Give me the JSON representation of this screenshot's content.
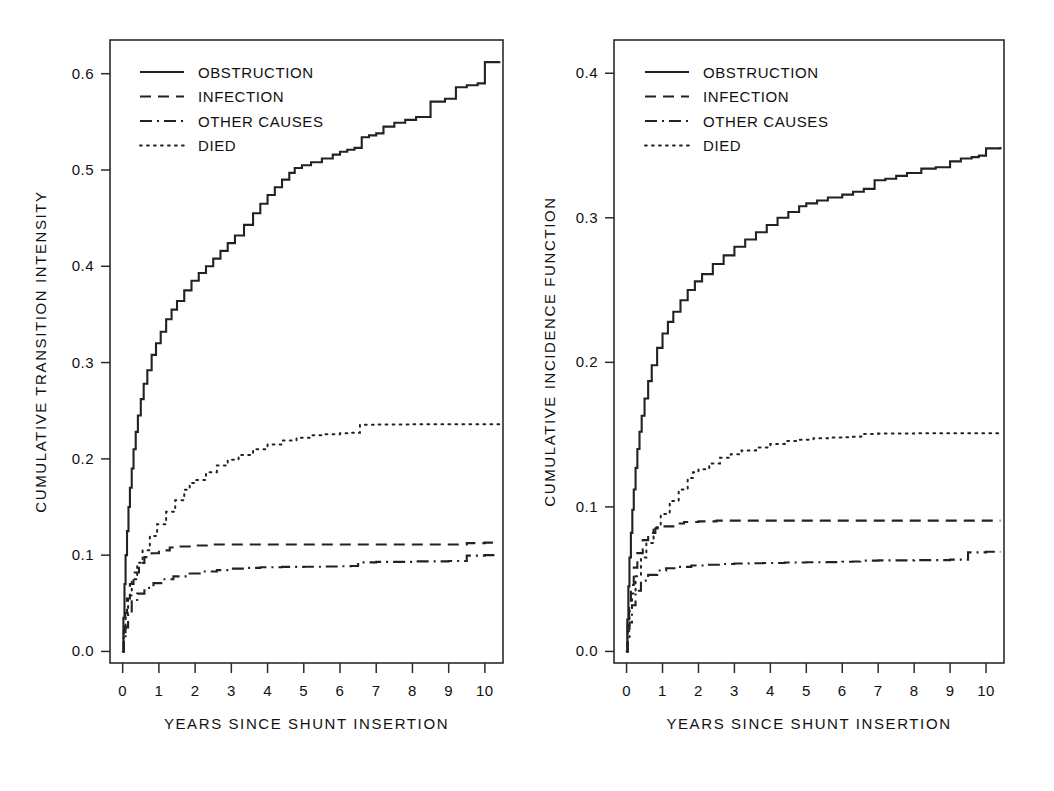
{
  "figure": {
    "background": "#ffffff",
    "line_color": "#222222"
  },
  "panels": [
    {
      "id": "left",
      "ylabel": "CUMULATIVE TRANSITION INTENSITY",
      "xlabel": "YEARS SINCE SHUNT INSERTION",
      "yticks": [
        "0.0",
        "0.1",
        "0.2",
        "0.3",
        "0.4",
        "0.5",
        "0.6"
      ],
      "xticks": [
        "0",
        "1",
        "2",
        "3",
        "4",
        "5",
        "6",
        "7",
        "8",
        "9",
        "10"
      ],
      "legend": [
        {
          "label": "OBSTRUCTION",
          "style": "solid"
        },
        {
          "label": "INFECTION",
          "style": "dashed"
        },
        {
          "label": "OTHER CAUSES",
          "style": "dashdot"
        },
        {
          "label": "DIED",
          "style": "dotted"
        }
      ]
    },
    {
      "id": "right",
      "ylabel": "CUMULATIVE INCIDENCE FUNCTION",
      "xlabel": "YEARS SINCE SHUNT INSERTION",
      "yticks": [
        "0.0",
        "0.1",
        "0.2",
        "0.3",
        "0.4"
      ],
      "xticks": [
        "0",
        "1",
        "2",
        "3",
        "4",
        "5",
        "6",
        "7",
        "8",
        "9",
        "10"
      ],
      "legend": [
        {
          "label": "OBSTRUCTION",
          "style": "solid"
        },
        {
          "label": "INFECTION",
          "style": "dashed"
        },
        {
          "label": "OTHER CAUSES",
          "style": "dashdot"
        },
        {
          "label": "DIED",
          "style": "dotted"
        }
      ]
    }
  ],
  "chart_data": [
    {
      "type": "line",
      "panel": "left",
      "title": "",
      "xlabel": "YEARS SINCE SHUNT INSERTION",
      "ylabel": "CUMULATIVE TRANSITION INTENSITY",
      "xlim": [
        -0.35,
        10.5
      ],
      "ylim": [
        -0.012,
        0.635
      ],
      "xticks": [
        0,
        1,
        2,
        3,
        4,
        5,
        6,
        7,
        8,
        9,
        10
      ],
      "yticks": [
        0.0,
        0.1,
        0.2,
        0.3,
        0.4,
        0.5,
        0.6
      ],
      "grid": false,
      "legend_position": "upper-left",
      "series": [
        {
          "name": "OBSTRUCTION",
          "style": "solid",
          "x": [
            0,
            0.02,
            0.05,
            0.08,
            0.12,
            0.16,
            0.2,
            0.25,
            0.3,
            0.36,
            0.42,
            0.5,
            0.58,
            0.68,
            0.8,
            0.92,
            1.05,
            1.2,
            1.35,
            1.5,
            1.7,
            1.9,
            2.1,
            2.3,
            2.5,
            2.7,
            2.9,
            3.1,
            3.35,
            3.6,
            3.8,
            4.0,
            4.2,
            4.4,
            4.6,
            4.75,
            4.95,
            5.2,
            5.5,
            5.8,
            6.0,
            6.2,
            6.4,
            6.6,
            6.8,
            7.0,
            7.2,
            7.5,
            7.8,
            8.1,
            8.5,
            8.9,
            9.2,
            9.5,
            9.8,
            10.0,
            10.4
          ],
          "y": [
            0.0,
            0.035,
            0.07,
            0.1,
            0.125,
            0.15,
            0.17,
            0.19,
            0.21,
            0.228,
            0.245,
            0.262,
            0.278,
            0.292,
            0.308,
            0.32,
            0.332,
            0.345,
            0.355,
            0.364,
            0.375,
            0.385,
            0.393,
            0.4,
            0.408,
            0.416,
            0.424,
            0.432,
            0.443,
            0.455,
            0.465,
            0.474,
            0.482,
            0.49,
            0.497,
            0.502,
            0.505,
            0.508,
            0.512,
            0.516,
            0.519,
            0.521,
            0.523,
            0.534,
            0.536,
            0.538,
            0.545,
            0.549,
            0.552,
            0.555,
            0.571,
            0.574,
            0.586,
            0.588,
            0.59,
            0.612,
            0.613
          ]
        },
        {
          "name": "INFECTION",
          "style": "dashed",
          "x": [
            0,
            0.03,
            0.07,
            0.12,
            0.2,
            0.3,
            0.45,
            0.6,
            0.8,
            1.0,
            1.3,
            1.6,
            2.0,
            2.5,
            3.0,
            4.0,
            5.0,
            6.0,
            7.0,
            8.0,
            9.0,
            9.3,
            9.5,
            10.0,
            10.4
          ],
          "y": [
            0.0,
            0.022,
            0.04,
            0.055,
            0.07,
            0.082,
            0.092,
            0.098,
            0.102,
            0.105,
            0.108,
            0.109,
            0.11,
            0.111,
            0.111,
            0.111,
            0.111,
            0.111,
            0.111,
            0.111,
            0.111,
            0.111,
            0.1125,
            0.113,
            0.113
          ]
        },
        {
          "name": "OTHER CAUSES",
          "style": "dashdot",
          "x": [
            0,
            0.03,
            0.08,
            0.15,
            0.25,
            0.4,
            0.6,
            0.85,
            1.1,
            1.4,
            1.8,
            2.2,
            2.6,
            3.0,
            3.4,
            3.8,
            4.4,
            5.0,
            5.6,
            6.0,
            6.3,
            6.5,
            7.0,
            8.0,
            9.0,
            9.3,
            9.5,
            10.0,
            10.4
          ],
          "y": [
            0.0,
            0.012,
            0.025,
            0.04,
            0.052,
            0.06,
            0.066,
            0.071,
            0.075,
            0.078,
            0.081,
            0.083,
            0.0845,
            0.086,
            0.0868,
            0.0875,
            0.0878,
            0.088,
            0.0882,
            0.0885,
            0.0888,
            0.0925,
            0.093,
            0.0935,
            0.094,
            0.094,
            0.0995,
            0.1,
            0.1
          ]
        },
        {
          "name": "DIED",
          "style": "dotted",
          "x": [
            0,
            0.03,
            0.08,
            0.15,
            0.25,
            0.4,
            0.55,
            0.75,
            0.95,
            1.2,
            1.45,
            1.7,
            1.85,
            2.0,
            2.3,
            2.6,
            2.9,
            3.2,
            3.6,
            4.0,
            4.4,
            4.8,
            5.2,
            5.6,
            6.0,
            6.3,
            6.5,
            6.55,
            7.0,
            8.0,
            9.0,
            10.0,
            10.4
          ],
          "y": [
            0.0,
            0.02,
            0.04,
            0.058,
            0.075,
            0.092,
            0.105,
            0.12,
            0.132,
            0.145,
            0.157,
            0.168,
            0.175,
            0.178,
            0.186,
            0.193,
            0.199,
            0.204,
            0.21,
            0.215,
            0.219,
            0.222,
            0.2245,
            0.2255,
            0.2265,
            0.227,
            0.2272,
            0.2355,
            0.2358,
            0.236,
            0.236,
            0.236,
            0.236
          ]
        }
      ]
    },
    {
      "type": "line",
      "panel": "right",
      "title": "",
      "xlabel": "YEARS SINCE SHUNT INSERTION",
      "ylabel": "CUMULATIVE INCIDENCE FUNCTION",
      "xlim": [
        -0.35,
        10.5
      ],
      "ylim": [
        -0.008,
        0.423
      ],
      "xticks": [
        0,
        1,
        2,
        3,
        4,
        5,
        6,
        7,
        8,
        9,
        10
      ],
      "yticks": [
        0.0,
        0.1,
        0.2,
        0.3,
        0.4
      ],
      "grid": false,
      "legend_position": "upper-left",
      "series": [
        {
          "name": "OBSTRUCTION",
          "style": "solid",
          "x": [
            0,
            0.02,
            0.05,
            0.08,
            0.12,
            0.16,
            0.2,
            0.25,
            0.3,
            0.36,
            0.42,
            0.5,
            0.6,
            0.7,
            0.85,
            1.0,
            1.15,
            1.3,
            1.5,
            1.7,
            1.9,
            2.1,
            2.4,
            2.7,
            3.0,
            3.3,
            3.6,
            3.9,
            4.2,
            4.5,
            4.8,
            5.0,
            5.3,
            5.6,
            6.0,
            6.3,
            6.6,
            6.9,
            7.2,
            7.5,
            7.8,
            8.2,
            8.6,
            9.0,
            9.3,
            9.6,
            9.8,
            10.0,
            10.4
          ],
          "y": [
            0.0,
            0.022,
            0.045,
            0.065,
            0.082,
            0.098,
            0.112,
            0.127,
            0.14,
            0.152,
            0.163,
            0.175,
            0.187,
            0.198,
            0.21,
            0.22,
            0.228,
            0.235,
            0.243,
            0.25,
            0.256,
            0.261,
            0.268,
            0.274,
            0.28,
            0.285,
            0.29,
            0.295,
            0.3,
            0.304,
            0.308,
            0.31,
            0.312,
            0.314,
            0.316,
            0.318,
            0.32,
            0.326,
            0.327,
            0.329,
            0.331,
            0.334,
            0.335,
            0.339,
            0.341,
            0.342,
            0.343,
            0.348,
            0.349
          ]
        },
        {
          "name": "INFECTION",
          "style": "dashed",
          "x": [
            0,
            0.03,
            0.07,
            0.12,
            0.2,
            0.3,
            0.45,
            0.6,
            0.8,
            1.0,
            1.3,
            1.6,
            2.0,
            2.5,
            3.0,
            4.0,
            5.0,
            6.0,
            7.0,
            8.0,
            9.0,
            10.0,
            10.4
          ],
          "y": [
            0.0,
            0.018,
            0.033,
            0.046,
            0.058,
            0.068,
            0.077,
            0.082,
            0.085,
            0.0865,
            0.0885,
            0.0895,
            0.09,
            0.0905,
            0.0905,
            0.0905,
            0.0905,
            0.0905,
            0.0905,
            0.0905,
            0.0905,
            0.0905,
            0.0905
          ]
        },
        {
          "name": "OTHER CAUSES",
          "style": "dashdot",
          "x": [
            0,
            0.03,
            0.08,
            0.15,
            0.25,
            0.4,
            0.6,
            0.85,
            1.1,
            1.4,
            1.8,
            2.2,
            2.6,
            3.0,
            3.4,
            3.8,
            4.4,
            5.0,
            5.6,
            6.0,
            6.3,
            6.5,
            7.0,
            8.0,
            9.0,
            9.3,
            9.5,
            10.0,
            10.4
          ],
          "y": [
            0.0,
            0.01,
            0.02,
            0.032,
            0.042,
            0.049,
            0.053,
            0.056,
            0.0575,
            0.0585,
            0.0595,
            0.06,
            0.0605,
            0.0608,
            0.061,
            0.0612,
            0.0615,
            0.0617,
            0.0618,
            0.062,
            0.0622,
            0.0628,
            0.063,
            0.0632,
            0.0635,
            0.0635,
            0.0685,
            0.069,
            0.069
          ]
        },
        {
          "name": "DIED",
          "style": "dotted",
          "x": [
            0,
            0.03,
            0.08,
            0.15,
            0.25,
            0.4,
            0.55,
            0.75,
            0.95,
            1.2,
            1.45,
            1.7,
            1.85,
            2.0,
            2.3,
            2.6,
            2.9,
            3.2,
            3.6,
            4.0,
            4.4,
            4.8,
            5.2,
            5.6,
            6.0,
            6.3,
            6.5,
            6.55,
            7.0,
            8.0,
            9.0,
            10.0,
            10.4
          ],
          "y": [
            0.0,
            0.014,
            0.028,
            0.04,
            0.052,
            0.065,
            0.075,
            0.086,
            0.095,
            0.104,
            0.112,
            0.12,
            0.124,
            0.126,
            0.13,
            0.134,
            0.1365,
            0.139,
            0.141,
            0.1435,
            0.1455,
            0.1465,
            0.1475,
            0.148,
            0.1482,
            0.1485,
            0.1487,
            0.1505,
            0.1507,
            0.151,
            0.151,
            0.151,
            0.151
          ]
        }
      ]
    }
  ]
}
